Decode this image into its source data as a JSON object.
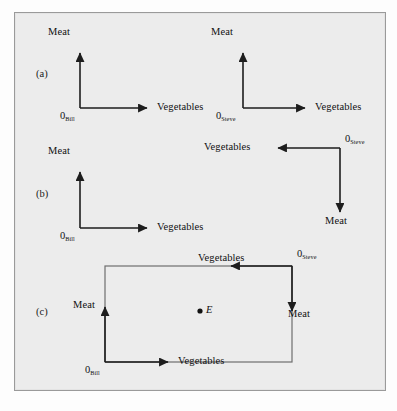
{
  "figure": {
    "background_color": "#ececec",
    "line_color": "#1d1d1d",
    "box_color": "#6e6e6e"
  },
  "panels": [
    {
      "letter": "(a)",
      "diagrams": [
        {
          "owner": "Bill",
          "origin_label": "0",
          "origin_subscript": "Bill",
          "vertical_axis_label": "Meat",
          "horizontal_axis_label": "Vegetables",
          "orientation": "normal"
        },
        {
          "owner": "Steve",
          "origin_label": "0",
          "origin_subscript": "Steve",
          "vertical_axis_label": "Meat",
          "horizontal_axis_label": "Vegetables",
          "orientation": "normal"
        }
      ]
    },
    {
      "letter": "(b)",
      "diagrams": [
        {
          "owner": "Bill",
          "origin_label": "0",
          "origin_subscript": "Bill",
          "vertical_axis_label": "Meat",
          "horizontal_axis_label": "Vegetables",
          "orientation": "normal"
        },
        {
          "owner": "Steve",
          "origin_label": "0",
          "origin_subscript": "Steve",
          "vertical_axis_label": "Meat",
          "horizontal_axis_label": "Vegetables",
          "orientation": "rotated-180"
        }
      ]
    },
    {
      "letter": "(c)",
      "diagrams": [
        {
          "owner": "Bill",
          "origin_label": "0",
          "origin_subscript": "Bill",
          "vertical_axis_label": "Meat",
          "horizontal_axis_label": "Vegetables",
          "orientation": "normal"
        },
        {
          "owner": "Steve",
          "origin_label": "0",
          "origin_subscript": "Steve",
          "vertical_axis_label": "Meat",
          "horizontal_axis_label": "Vegetables",
          "orientation": "rotated-180"
        }
      ],
      "point": {
        "label": "E",
        "style": "italic"
      }
    }
  ]
}
